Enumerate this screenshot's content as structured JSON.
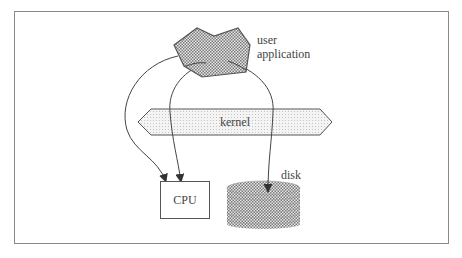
{
  "diagram": {
    "type": "system-architecture",
    "nodes": {
      "user_application": {
        "label_line1": "user",
        "label_line2": "application",
        "shape": "irregular-polygon",
        "fill": "checker-dark"
      },
      "kernel": {
        "label": "kernel",
        "shape": "elongated-hexagon",
        "fill": "dotted-light"
      },
      "cpu": {
        "label": "CPU",
        "shape": "rectangle"
      },
      "disk": {
        "label": "disk",
        "shape": "stacked-cylinder",
        "fill": "checker-dark"
      }
    },
    "edges": [
      {
        "from": "user_application",
        "to": "cpu",
        "via": "direct (bypass kernel)"
      },
      {
        "from": "user_application",
        "to": "cpu",
        "via": "kernel"
      },
      {
        "from": "user_application",
        "to": "disk",
        "via": "kernel"
      }
    ],
    "colors": {
      "stroke": "#555555",
      "frame": "#888888",
      "text": "#444444",
      "blob_fill_a": "#8a8a8a",
      "blob_fill_b": "#e8e8e8",
      "kernel_fill": "#eeeeee"
    }
  }
}
